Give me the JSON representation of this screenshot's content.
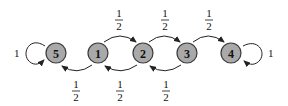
{
  "diagram": {
    "type": "markov-chain-state-diagram",
    "colors": {
      "node_fill": "#a9a9a9",
      "node_stroke": "#3a3a3a",
      "edge": "#222222",
      "background": "#ffffff"
    },
    "nodes": [
      {
        "id": "5",
        "label": "5",
        "cx": 56,
        "cy": 53
      },
      {
        "id": "1",
        "label": "1",
        "cx": 98,
        "cy": 53
      },
      {
        "id": "2",
        "label": "2",
        "cx": 143,
        "cy": 53
      },
      {
        "id": "3",
        "label": "3",
        "cx": 187,
        "cy": 53
      },
      {
        "id": "4",
        "label": "4",
        "cx": 231,
        "cy": 53
      }
    ],
    "edges": [
      {
        "from": "1",
        "to": "2",
        "position": "upper",
        "label_num": "1",
        "label_den": "2"
      },
      {
        "from": "2",
        "to": "3",
        "position": "upper",
        "label_num": "1",
        "label_den": "2"
      },
      {
        "from": "3",
        "to": "4",
        "position": "upper",
        "label_num": "1",
        "label_den": "2"
      },
      {
        "from": "1",
        "to": "5",
        "position": "lower",
        "label_num": "1",
        "label_den": "2"
      },
      {
        "from": "2",
        "to": "1",
        "position": "lower",
        "label_num": "1",
        "label_den": "2"
      },
      {
        "from": "3",
        "to": "2",
        "position": "lower",
        "label_num": "1",
        "label_den": "2"
      }
    ],
    "self_loops": [
      {
        "node": "5",
        "side": "left",
        "label": "1"
      },
      {
        "node": "4",
        "side": "right",
        "label": "1"
      }
    ]
  }
}
